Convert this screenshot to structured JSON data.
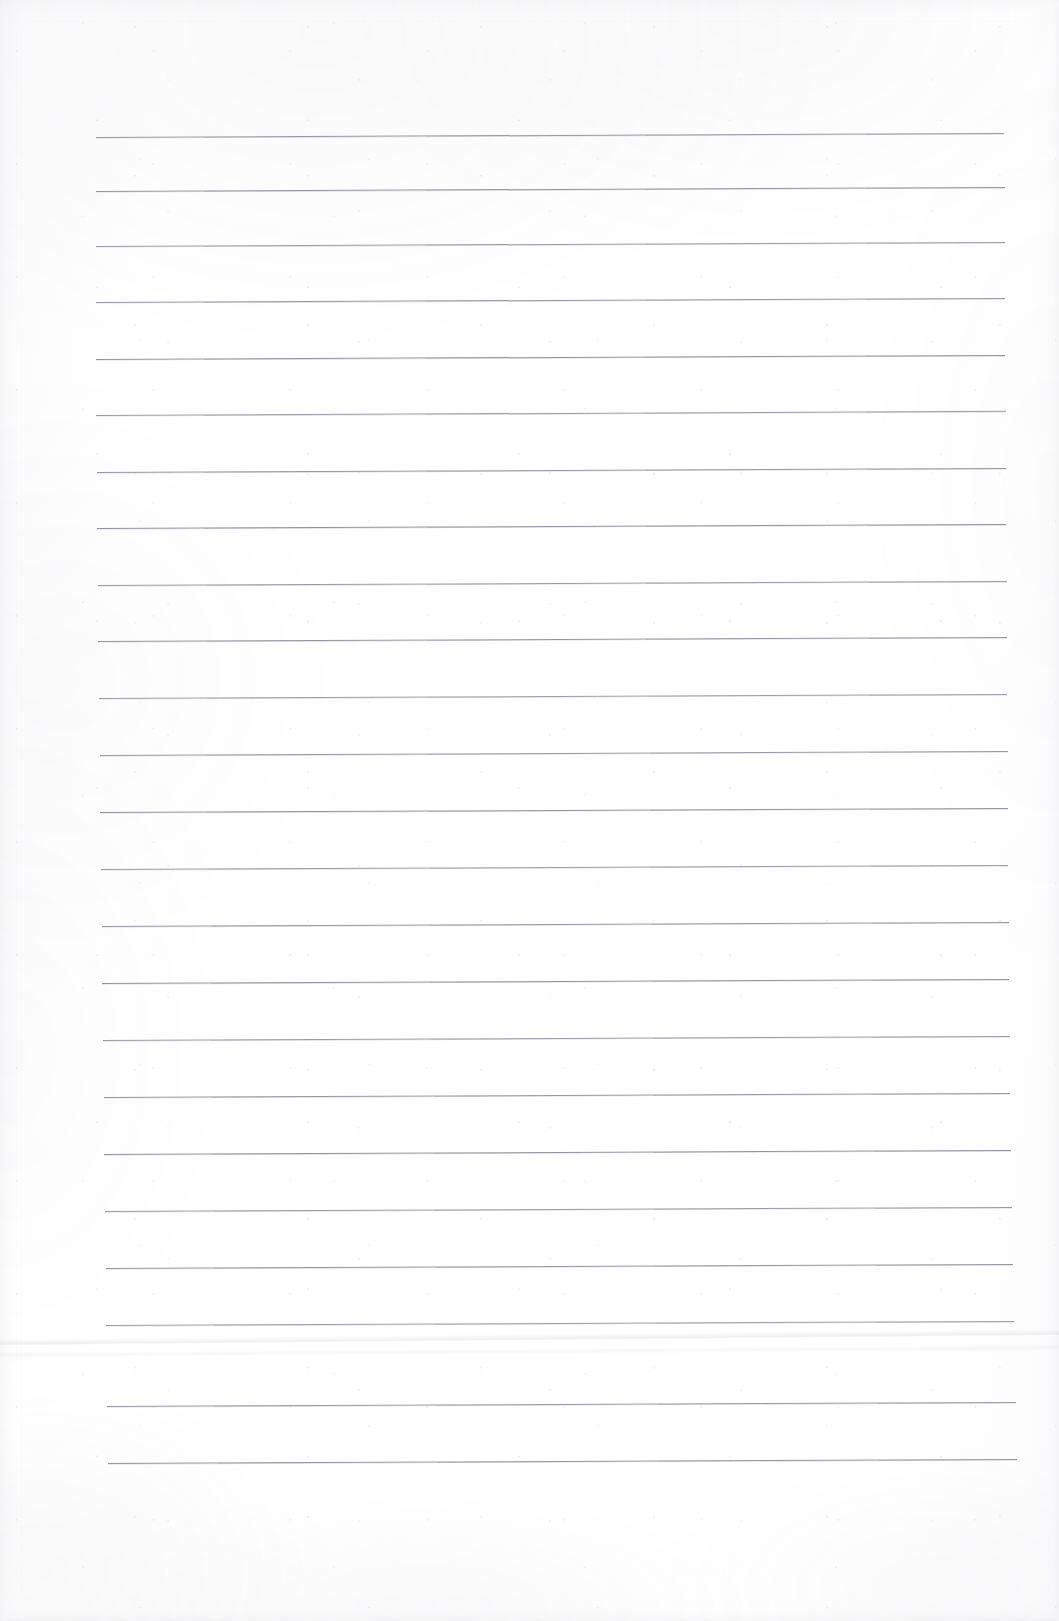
{
  "document": {
    "kind": "scanned-lined-paper",
    "title": "Blank ruled notebook page",
    "page_width": 1059,
    "page_height": 1621,
    "page_color": "#ffffff",
    "has_visible_text": false,
    "text_content": "",
    "handwriting": "",
    "header_text": "",
    "footer_text": "",
    "page_number": "",
    "margin_line": "none"
  },
  "ruling": {
    "style": "single-ruled horizontal lines",
    "line_color": "#787884",
    "line_thickness_px": 1,
    "line_count": 24,
    "average_spacing_px": 57,
    "tilt_degrees": -0.26,
    "left_margin_px": 96,
    "right_margin_px": 1008,
    "first_line_y_px": 137,
    "last_line_y_px": 1487
  },
  "lines": [
    {
      "index": 1,
      "y": 137,
      "left": 96,
      "right": 1004
    },
    {
      "index": 2,
      "y": 191,
      "left": 96,
      "right": 1005
    },
    {
      "index": 3,
      "y": 246,
      "left": 96,
      "right": 1005
    },
    {
      "index": 4,
      "y": 302,
      "left": 96,
      "right": 1005
    },
    {
      "index": 5,
      "y": 359,
      "left": 96,
      "right": 1005
    },
    {
      "index": 6,
      "y": 415,
      "left": 96,
      "right": 1006
    },
    {
      "index": 7,
      "y": 472,
      "left": 97,
      "right": 1006
    },
    {
      "index": 8,
      "y": 528,
      "left": 97,
      "right": 1006
    },
    {
      "index": 9,
      "y": 585,
      "left": 98,
      "right": 1007
    },
    {
      "index": 10,
      "y": 641,
      "left": 98,
      "right": 1007
    },
    {
      "index": 11,
      "y": 698,
      "left": 99,
      "right": 1007
    },
    {
      "index": 12,
      "y": 755,
      "left": 100,
      "right": 1008
    },
    {
      "index": 13,
      "y": 812,
      "left": 100,
      "right": 1008
    },
    {
      "index": 14,
      "y": 869,
      "left": 101,
      "right": 1008
    },
    {
      "index": 15,
      "y": 926,
      "left": 102,
      "right": 1009
    },
    {
      "index": 16,
      "y": 983,
      "left": 102,
      "right": 1009
    },
    {
      "index": 17,
      "y": 1040,
      "left": 103,
      "right": 1010
    },
    {
      "index": 18,
      "y": 1097,
      "left": 104,
      "right": 1010
    },
    {
      "index": 19,
      "y": 1154,
      "left": 104,
      "right": 1011
    },
    {
      "index": 20,
      "y": 1211,
      "left": 105,
      "right": 1012
    },
    {
      "index": 21,
      "y": 1268,
      "left": 106,
      "right": 1013
    },
    {
      "index": 22,
      "y": 1325,
      "left": 106,
      "right": 1014
    },
    {
      "index": 23,
      "y": 1406,
      "left": 107,
      "right": 1016
    },
    {
      "index": 24,
      "y": 1463,
      "left": 108,
      "right": 1017
    }
  ],
  "artifacts": {
    "crease": {
      "label": "horizontal fold crease",
      "y": 1339,
      "tilt_degrees": -0.55,
      "color": "#bcbec8"
    },
    "crease_secondary": {
      "label": "secondary faint crease",
      "y": 1352,
      "tilt_degrees": -0.4,
      "color": "#c4c6d0"
    },
    "paper_tone": "#fdfdfe",
    "scan_shadow_color": "#bebec8"
  }
}
